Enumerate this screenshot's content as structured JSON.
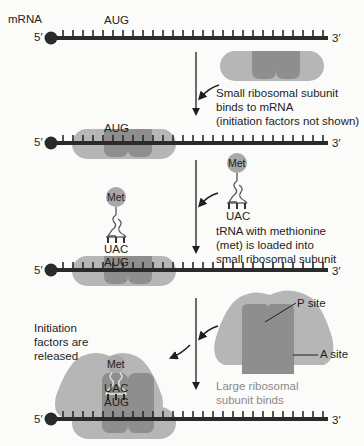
{
  "diagram": {
    "colors": {
      "background": "#fbfbf9",
      "strand": "#2a2a2a",
      "ribosome_outer": "#b6b6b6",
      "ribosome_inner": "#8e8e8e",
      "met": "#a8a8a8",
      "label_gray": "#8a8a8a"
    },
    "mrna_label": "mRNA",
    "five_prime": "5′",
    "three_prime": "3′",
    "start_codon": "AUG",
    "anticodon": "UAC",
    "met_label": "Met",
    "steps": [
      {
        "id": "step1",
        "caption_lines": [
          "Small ribosomal subunit",
          "binds to mRNA",
          "(initiation factors not shown)"
        ]
      },
      {
        "id": "step2",
        "caption_lines": [
          "tRNA with methionine",
          "(met) is loaded into",
          "small ribosomal subunit"
        ]
      },
      {
        "id": "step3",
        "caption_lines": [
          "Initiation",
          "factors are",
          "released"
        ],
        "side_caption_lines": [
          "Large ribosomal",
          "subunit binds"
        ],
        "site_labels": {
          "p_site": "P site",
          "a_site": "A site"
        }
      }
    ]
  }
}
